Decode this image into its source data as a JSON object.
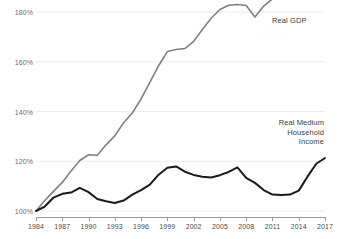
{
  "chart_data": {
    "type": "line",
    "title": "",
    "subtitle": "",
    "xlabel": "",
    "ylabel": "",
    "xlim": [
      1984,
      2017
    ],
    "ylim": [
      100,
      180
    ],
    "grid": true,
    "legend_position": "inline-annotation",
    "y_ticks": [
      "100%",
      "120%",
      "140%",
      "160%",
      "180%"
    ],
    "y_tick_values": [
      100,
      120,
      140,
      160,
      180
    ],
    "x_ticks": [
      "1984",
      "1987",
      "1990",
      "1993",
      "1996",
      "1999",
      "2002",
      "2005",
      "2008",
      "2011",
      "2014",
      "2017"
    ],
    "x_tick_values": [
      1984,
      1987,
      1990,
      1993,
      1996,
      1999,
      2002,
      2005,
      2008,
      2011,
      2014,
      2017
    ],
    "x": [
      1984,
      1985,
      1986,
      1987,
      1988,
      1989,
      1990,
      1991,
      1992,
      1993,
      1994,
      1995,
      1996,
      1997,
      1998,
      1999,
      2000,
      2001,
      2002,
      2003,
      2004,
      2005,
      2006,
      2007,
      2008,
      2009,
      2010,
      2011,
      2012,
      2013,
      2014,
      2015,
      2016,
      2017
    ],
    "series": [
      {
        "name": "Real GDP",
        "color": "#808080",
        "label_text": "Real GDP",
        "values": [
          100.0,
          104.2,
          107.9,
          111.5,
          116.1,
          120.3,
          122.6,
          122.4,
          126.6,
          130.2,
          135.5,
          139.4,
          145.1,
          151.7,
          158.4,
          164.1,
          164.9,
          165.3,
          168.2,
          173.0,
          177.5,
          181.0,
          182.7,
          183.0,
          182.6,
          178.0,
          182.4,
          185.3,
          189.5,
          192.9,
          197.9,
          203.3,
          206.4,
          211.0
        ]
      },
      {
        "name": "Real Medium Household Income",
        "color": "#1a1a1a",
        "label_text": "Real Medium\nHousehold\nIncome",
        "values": [
          100.0,
          101.8,
          105.4,
          106.9,
          107.4,
          109.3,
          107.6,
          104.8,
          103.9,
          103.2,
          104.2,
          106.6,
          108.4,
          110.6,
          114.6,
          117.4,
          117.9,
          115.8,
          114.5,
          113.8,
          113.5,
          114.4,
          115.7,
          117.5,
          113.3,
          111.3,
          108.4,
          106.6,
          106.4,
          106.6,
          108.2,
          113.8,
          119.0,
          121.3
        ]
      }
    ],
    "series_display": [
      {
        "key": "gdp",
        "points_px": "0,199 8.8,188.6 17.5,179.4 26.3,170.4 35,159.0 43.8,148.6 52.5,143.9 61.3,144.4 70,133.9 78.8,125.0 87.5,111.8 96.3,102.1 105,87.9 113.8,71.4 122.5,54.8 131.3,40.6 140,38.6 148.8,37.6 157.5,30.4 166.3,18.4 175,7.2 183.8,-1.5 192.5,-5.7 201.3,-6.5 210,-5.5 218.8,6.0 227.5,-5.0 236.3,-12.2 245,-22.7 253.8,-31.1 262.5,-43.6 271.3,-57.0 280,-64.8 288.8,-76.2"
      }
    ]
  },
  "annotations": {
    "gdp_label": "Real GDP",
    "income_label": "Real Medium\nHousehold\nIncome"
  }
}
